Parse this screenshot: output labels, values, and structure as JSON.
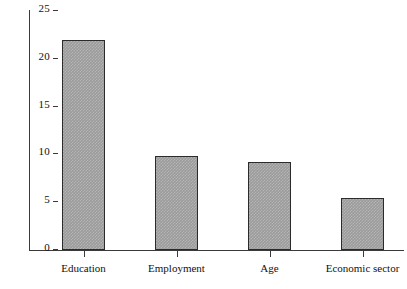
{
  "chart_data": {
    "type": "bar",
    "title": "",
    "xlabel": "",
    "ylabel": "",
    "categories": [
      "Education",
      "Employment",
      "Age",
      "Economic sector"
    ],
    "values": [
      22.0,
      9.8,
      9.2,
      5.4
    ],
    "ylim": [
      0,
      25
    ],
    "yticks": [
      0,
      5,
      10,
      15,
      20,
      25
    ],
    "ytick_labels": [
      "0",
      "5",
      "10",
      "15",
      "20",
      "25"
    ],
    "grid": false,
    "legend": null,
    "bar_color": "#9b9b9b",
    "bar_edge_color": "#2b2b2b",
    "axis_color": "#3a3a3a"
  },
  "caption": {
    "text": ""
  }
}
